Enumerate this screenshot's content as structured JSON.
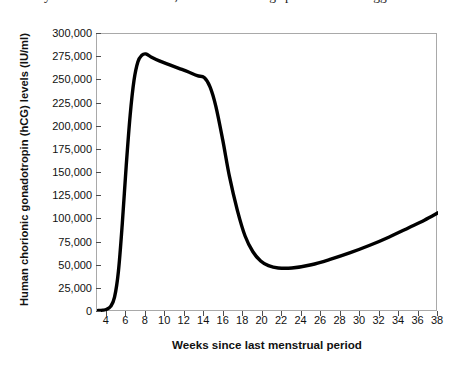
{
  "caption": {
    "text": "always occurs in the oviduct, where swimming sperm meet the egg."
  },
  "chart_data": {
    "type": "line",
    "title": "",
    "xlabel": "Weeks since last menstrual period",
    "ylabel": "Human chorionic gonadotropin (hCG) levels (IU/ml)",
    "xlim": [
      3,
      38
    ],
    "ylim": [
      0,
      300000
    ],
    "grid": false,
    "legend": null,
    "xticks": [
      4,
      6,
      8,
      10,
      12,
      14,
      16,
      18,
      20,
      22,
      24,
      26,
      28,
      30,
      32,
      34,
      36,
      38
    ],
    "xtick_labels": [
      "4",
      "6",
      "8",
      "10",
      "12",
      "14",
      "16",
      "18",
      "20",
      "22",
      "24",
      "26",
      "28",
      "30",
      "32",
      "34",
      "36",
      "38"
    ],
    "yticks": [
      0,
      25000,
      50000,
      75000,
      100000,
      125000,
      150000,
      175000,
      200000,
      225000,
      250000,
      275000,
      300000
    ],
    "ytick_labels": [
      "0",
      "25,000",
      "50,000",
      "75,000",
      "100,000",
      "125,000",
      "150,000",
      "175,000",
      "200,000",
      "225,000",
      "250,000",
      "275,000",
      "300,000"
    ],
    "series": [
      {
        "name": "hCG level",
        "color": "#000000",
        "line_width": 3.4,
        "x": [
          3.0,
          3.6,
          4.0,
          4.4,
          4.8,
          5.2,
          5.6,
          6.0,
          6.4,
          6.8,
          7.2,
          7.6,
          8.0,
          8.6,
          9.4,
          10.4,
          11.4,
          12.4,
          13.3,
          14.0,
          14.6,
          15.2,
          15.9,
          16.6,
          17.4,
          18.2,
          19.0,
          19.8,
          20.6,
          21.6,
          23.0,
          25.0,
          27.0,
          29.0,
          31.0,
          33.0,
          35.0,
          36.6,
          38.0
        ],
        "y": [
          1500,
          2000,
          3000,
          6000,
          16000,
          44000,
          96000,
          158000,
          212000,
          250000,
          270000,
          277000,
          278500,
          275000,
          271000,
          267000,
          263000,
          259000,
          255000,
          253000,
          243000,
          222000,
          186000,
          146000,
          110000,
          82000,
          65000,
          55000,
          50000,
          47500,
          47500,
          51000,
          57000,
          64000,
          72000,
          81000,
          91000,
          99000,
          107000
        ]
      }
    ]
  }
}
